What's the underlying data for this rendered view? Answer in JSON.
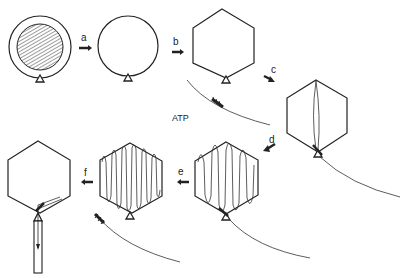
{
  "figure": {
    "cofactor_label": "ATP",
    "steps": [
      {
        "id": "a",
        "label": "a"
      },
      {
        "id": "b",
        "label": "b"
      },
      {
        "id": "c",
        "label": "c"
      },
      {
        "id": "d",
        "label": "d"
      },
      {
        "id": "e",
        "label": "e"
      },
      {
        "id": "f",
        "label": "f"
      }
    ],
    "stages": [
      {
        "name": "procapsid-with-scaffold",
        "shape": "circle",
        "content": "hatched-core"
      },
      {
        "name": "empty-procapsid",
        "shape": "circle",
        "content": "empty"
      },
      {
        "name": "expanded-capsid-with-dna-motor",
        "shape": "hexagon",
        "content": "dna-approaching"
      },
      {
        "name": "dna-entering-capsid",
        "shape": "hexagon",
        "content": "dna-strand"
      },
      {
        "name": "partially-filled-capsid",
        "shape": "hexagon",
        "content": "dna-loops"
      },
      {
        "name": "full-capsid-released",
        "shape": "hexagon",
        "content": "dna-loops-dense"
      },
      {
        "name": "mature-phage-with-tail",
        "shape": "hexagon",
        "content": "tail-attached"
      }
    ]
  }
}
